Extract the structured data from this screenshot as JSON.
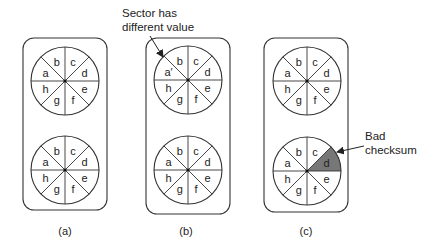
{
  "colors": {
    "stroke": "#333333",
    "bad_sector_fill": "#777777",
    "background": "#ffffff"
  },
  "sector_order": [
    "a",
    "b",
    "c",
    "d",
    "e",
    "f",
    "g",
    "h"
  ],
  "panels": [
    {
      "id": "a",
      "caption": "(a)",
      "box": {
        "x": 23,
        "y": 38,
        "w": 84,
        "h": 172
      },
      "disks": [
        {
          "cx": 65,
          "cy": 81,
          "r": 34,
          "labels": [
            "a",
            "b",
            "c",
            "d",
            "e",
            "f",
            "g",
            "h"
          ],
          "highlight": null
        },
        {
          "cx": 65,
          "cy": 170,
          "r": 34,
          "labels": [
            "a",
            "b",
            "c",
            "d",
            "e",
            "f",
            "g",
            "h"
          ],
          "highlight": null
        }
      ],
      "caption_pos": {
        "x": 65,
        "y": 235
      }
    },
    {
      "id": "b",
      "caption": "(b)",
      "box": {
        "x": 146,
        "y": 38,
        "w": 84,
        "h": 176
      },
      "disks": [
        {
          "cx": 188,
          "cy": 80,
          "r": 34,
          "labels": [
            "a′",
            "b",
            "c",
            "d",
            "e",
            "f",
            "g",
            "h"
          ],
          "highlight": null
        },
        {
          "cx": 188,
          "cy": 170,
          "r": 34,
          "labels": [
            "a",
            "b",
            "c",
            "d",
            "e",
            "f",
            "g",
            "h"
          ],
          "highlight": null
        }
      ],
      "caption_pos": {
        "x": 186,
        "y": 235
      }
    },
    {
      "id": "c",
      "caption": "(c)",
      "box": {
        "x": 264,
        "y": 38,
        "w": 84,
        "h": 174
      },
      "disks": [
        {
          "cx": 307,
          "cy": 81,
          "r": 34,
          "labels": [
            "a",
            "b",
            "c",
            "d",
            "e",
            "f",
            "g",
            "h"
          ],
          "highlight": null
        },
        {
          "cx": 307,
          "cy": 171,
          "r": 34,
          "labels": [
            "a",
            "b",
            "c",
            "d",
            "e",
            "f",
            "g",
            "h"
          ],
          "highlight": "d"
        }
      ],
      "caption_pos": {
        "x": 306,
        "y": 235
      }
    }
  ],
  "annotations": [
    {
      "id": "sector-different",
      "lines": [
        "Sector has",
        "different value"
      ],
      "x": 122,
      "y": 17,
      "line_height": 14,
      "arrow": {
        "x1": 150,
        "y1": 36,
        "x2": 163,
        "y2": 57
      }
    },
    {
      "id": "bad-checksum",
      "lines": [
        "Bad",
        "checksum"
      ],
      "x": 365,
      "y": 140,
      "line_height": 14,
      "arrow": {
        "x1": 364,
        "y1": 146,
        "x2": 337,
        "y2": 152
      }
    }
  ]
}
